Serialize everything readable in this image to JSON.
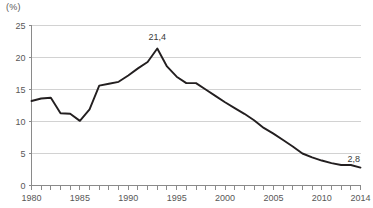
{
  "unit_label": "(%)",
  "chart_data": {
    "type": "line",
    "title": "",
    "subtitle": "",
    "xlabel": "",
    "ylabel": "(%)",
    "grid": true,
    "legend": false,
    "legend_position": "none",
    "decimal_separator": ",",
    "xlim": [
      1980,
      2014
    ],
    "ylim": [
      0,
      25
    ],
    "yticks": [
      0,
      5,
      10,
      15,
      20,
      25
    ],
    "ytick_labels": [
      "0",
      "5",
      "10",
      "15",
      "20",
      "25"
    ],
    "xticks": [
      1980,
      1985,
      1990,
      1995,
      2000,
      2005,
      2010,
      2014
    ],
    "xtick_labels": [
      "1980",
      "1985",
      "1990",
      "1995",
      "2000",
      "2005",
      "2010",
      "2014"
    ],
    "x_minor_tick_interval": 1,
    "x": [
      1980,
      1981,
      1982,
      1983,
      1984,
      1985,
      1986,
      1987,
      1988,
      1989,
      1990,
      1991,
      1992,
      1993,
      1994,
      1995,
      1996,
      1997,
      1998,
      1999,
      2000,
      2001,
      2002,
      2003,
      2004,
      2005,
      2006,
      2007,
      2008,
      2009,
      2010,
      2011,
      2012,
      2013,
      2014
    ],
    "values": [
      13.2,
      13.6,
      13.7,
      11.3,
      11.2,
      10.1,
      11.9,
      15.6,
      15.9,
      16.2,
      17.2,
      18.3,
      19.3,
      21.4,
      18.6,
      17.0,
      16.0,
      16.0,
      15.0,
      14.0,
      13.0,
      12.1,
      11.2,
      10.2,
      9.0,
      8.1,
      7.1,
      6.1,
      5.0,
      4.4,
      3.9,
      3.5,
      3.2,
      3.2,
      2.8
    ],
    "series": [
      {
        "name": "",
        "color": "#231f20",
        "values": [
          13.2,
          13.6,
          13.7,
          11.3,
          11.2,
          10.1,
          11.9,
          15.6,
          15.9,
          16.2,
          17.2,
          18.3,
          19.3,
          21.4,
          18.6,
          17.0,
          16.0,
          16.0,
          15.0,
          14.0,
          13.0,
          12.1,
          11.2,
          10.2,
          9.0,
          8.1,
          7.1,
          6.1,
          5.0,
          4.4,
          3.9,
          3.5,
          3.2,
          3.2,
          2.8
        ]
      }
    ],
    "annotations": [
      {
        "name": "peak-label",
        "text": "21,4",
        "x": 1993,
        "y": 21.4,
        "dy": -9
      },
      {
        "name": "end-label",
        "text": "2,8",
        "x": 2013.3,
        "y": 2.8,
        "dy": -6
      }
    ]
  },
  "colors": {
    "line": "#231f20",
    "grid": "#d2d2d2",
    "axis": "#8a8a8a",
    "tick_text": "#575757",
    "annotation_text": "#3a3a3a",
    "background": "#ffffff"
  }
}
